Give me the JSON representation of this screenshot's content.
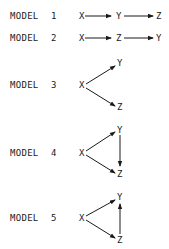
{
  "models": [
    {
      "label": "MODEL",
      "number": "1",
      "nodes": {
        "a": "X",
        "b": "Y",
        "c": "Z"
      },
      "edges": [
        "X->Y",
        "Y->Z"
      ]
    },
    {
      "label": "MODEL",
      "number": "2",
      "nodes": {
        "a": "X",
        "b": "Z",
        "c": "Y"
      },
      "edges": [
        "X->Z",
        "Z->Y"
      ]
    },
    {
      "label": "MODEL",
      "number": "3",
      "nodes": {
        "x": "X",
        "y": "Y",
        "z": "Z"
      },
      "edges": [
        "X->Y",
        "X->Z"
      ]
    },
    {
      "label": "MODEL",
      "number": "4",
      "nodes": {
        "x": "X",
        "y": "Y",
        "z": "Z"
      },
      "edges": [
        "X->Y",
        "X->Z",
        "Y->Z"
      ]
    },
    {
      "label": "MODEL",
      "number": "5",
      "nodes": {
        "x": "X",
        "y": "Y",
        "z": "Z"
      },
      "edges": [
        "X->Y",
        "X->Z",
        "Z->Y"
      ]
    }
  ]
}
